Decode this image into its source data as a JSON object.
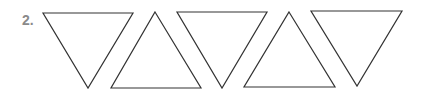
{
  "exercise": {
    "number_label": "2.",
    "shapes": [
      {
        "type": "triangle",
        "orientation": "down",
        "points": "43,13 133,13 88,88"
      },
      {
        "type": "triangle",
        "orientation": "up",
        "points": "155,12 201,88 111,88"
      },
      {
        "type": "triangle",
        "orientation": "down",
        "points": "177,12 267,12 222,88"
      },
      {
        "type": "triangle",
        "orientation": "up",
        "points": "289,12 335,87 244,87"
      },
      {
        "type": "triangle",
        "orientation": "down",
        "points": "311,11 402,11 357,86"
      }
    ],
    "colors": {
      "label": "#8a8a8a",
      "stroke": "#333333"
    }
  }
}
